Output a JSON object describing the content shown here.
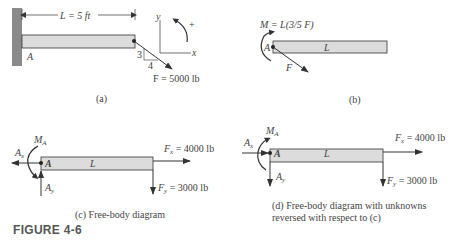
{
  "figure_label": "FIGURE 4-6",
  "colors": {
    "beam_fill": "#dcdcdc",
    "wall_fill": "#8a8a8a",
    "line": "#333333"
  },
  "panel_a": {
    "caption": "(a)",
    "dimension_label": "L = 5 ft",
    "point_label": "A",
    "slope_rise": "3",
    "slope_run": "4",
    "force_label": "F = 5000 lb",
    "axis_y": "y",
    "axis_x": "x",
    "moment_sign": "+"
  },
  "panel_b": {
    "caption": "(b)",
    "moment_label": "M = L(3/5 F)",
    "point_label": "A",
    "beam_label": "L",
    "force_label": "F"
  },
  "panel_c": {
    "caption": "(c)  Free-body diagram",
    "moment_label": "M",
    "moment_sub": "A",
    "ax_label": "A",
    "ax_sub": "x",
    "ay_label": "A",
    "ay_sub": "y",
    "point_label": "A",
    "beam_label": "L",
    "fx_label": "F",
    "fx_sub": "x",
    "fx_value": " = 4000 lb",
    "fy_label": "F",
    "fy_sub": "y",
    "fy_value": " = 3000 lb"
  },
  "panel_d": {
    "caption_line1": "(d)  Free-body diagram with unknowns",
    "caption_line2": "reversed with respect to (c)",
    "moment_label": "M",
    "moment_sub": "A",
    "ax_label": "A",
    "ax_sub": "x",
    "ay_label": "A",
    "ay_sub": "y",
    "point_label": "A",
    "beam_label": "L",
    "fx_label": "F",
    "fx_sub": "x",
    "fx_value": " = 4000 lb",
    "fy_label": "F",
    "fy_sub": "y",
    "fy_value": " = 3000 lb"
  }
}
